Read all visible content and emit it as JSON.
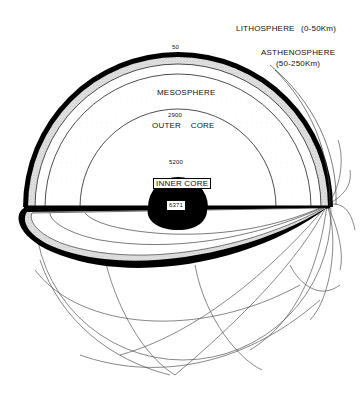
{
  "diagram": {
    "labels": {
      "lithosphere": "LITHOSPHERE",
      "lithosphere_range": "(0-50Km)",
      "asthenosphere": "ASTHENOSPHERE",
      "asthenosphere_range": "(50-250Km)",
      "mesosphere": "MESOSPHERE",
      "outer_core": "OUTER    CORE",
      "inner_core": "INNER CORE"
    },
    "depths_km": {
      "d50": "50",
      "d250": "250",
      "d2900": "2900",
      "d5200": "5200",
      "d6371": "6371"
    },
    "colors": {
      "line": "#111111",
      "stipple": "#c8c8c8",
      "background": "#ffffff",
      "core": "#000000"
    }
  }
}
